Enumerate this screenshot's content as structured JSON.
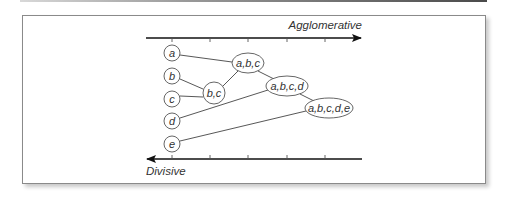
{
  "figure": {
    "axes": {
      "top": {
        "label": "Agglomerative",
        "direction": "left-to-right",
        "x_start": 146,
        "x_end": 362,
        "y": 38,
        "ticks": [
          172,
          210,
          248,
          287,
          325
        ]
      },
      "bottom": {
        "label": "Divisive",
        "direction": "right-to-left",
        "x_start": 146,
        "x_end": 362,
        "y": 159,
        "ticks": [
          172,
          210,
          248,
          287,
          325
        ]
      }
    },
    "leaves": [
      {
        "id": "a",
        "label": "a",
        "cx": 172,
        "cy": 53
      },
      {
        "id": "b",
        "label": "b",
        "cx": 172,
        "cy": 76
      },
      {
        "id": "c",
        "label": "c",
        "cx": 172,
        "cy": 99
      },
      {
        "id": "d",
        "label": "d",
        "cx": 172,
        "cy": 121
      },
      {
        "id": "e",
        "label": "e",
        "cx": 172,
        "cy": 144
      }
    ],
    "clusters": [
      {
        "id": "bc",
        "label": "b,c",
        "cx": 214,
        "cy": 93
      },
      {
        "id": "abc",
        "label": "a,b,c",
        "cx": 248,
        "cy": 63
      },
      {
        "id": "abcd",
        "label": "a,b,c,d",
        "cx": 287,
        "cy": 86
      },
      {
        "id": "abcde",
        "label": "a,b,c,d,e",
        "cx": 329,
        "cy": 108
      }
    ],
    "edges": [
      {
        "from": "b",
        "to": "bc"
      },
      {
        "from": "c",
        "to": "bc"
      },
      {
        "from": "a",
        "to": "abc"
      },
      {
        "from": "bc",
        "to": "abc"
      },
      {
        "from": "abc",
        "to": "abcd"
      },
      {
        "from": "d",
        "to": "abcd"
      },
      {
        "from": "abcd",
        "to": "abcde"
      },
      {
        "from": "e",
        "to": "abcde"
      }
    ]
  }
}
